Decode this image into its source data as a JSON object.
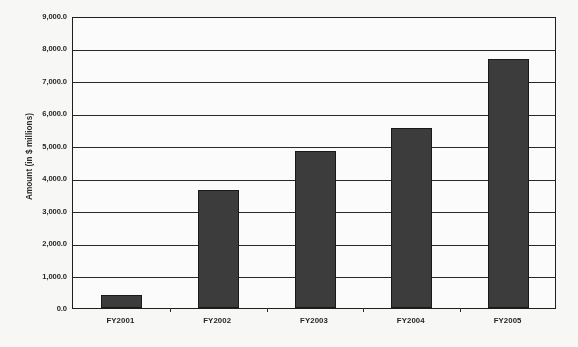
{
  "chart_data": {
    "type": "bar",
    "title": "",
    "xlabel": "",
    "ylabel": "Amount (in $ millions)",
    "categories": [
      "FY2001",
      "FY2002",
      "FY2003",
      "FY2004",
      "FY2005"
    ],
    "values": [
      400,
      3650,
      4850,
      5550,
      7680
    ],
    "ylim": [
      0,
      9000
    ],
    "ytick_step": 1000,
    "ytick_labels": [
      "9,000.0",
      "8,000.0",
      "7,000.0",
      "6,000.0",
      "5,000.0",
      "4,000.0",
      "3,000.0",
      "2,000.0",
      "1,000.0",
      "0.0"
    ],
    "ytick_values": [
      9000,
      8000,
      7000,
      6000,
      5000,
      4000,
      3000,
      2000,
      1000,
      0
    ],
    "grid": true,
    "grid_orientation": "horizontal",
    "legend": null,
    "series": [
      {
        "name": "Amount",
        "color": "#3a3a3a",
        "values": [
          400,
          3650,
          4850,
          5550,
          7680
        ]
      }
    ]
  },
  "axis": {
    "y_title": "Amount (in $ millions)"
  }
}
